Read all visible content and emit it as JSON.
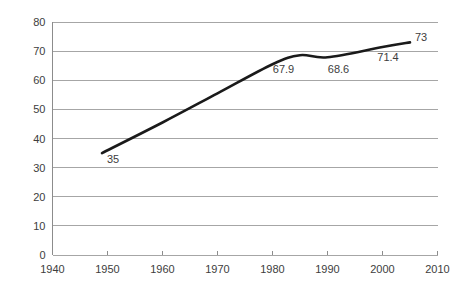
{
  "chart_data": {
    "type": "line",
    "title": "",
    "subtitle": "",
    "xlabel": "",
    "ylabel": "",
    "xlim": [
      1940,
      2010
    ],
    "ylim": [
      0,
      80
    ],
    "grid": true,
    "legend": false,
    "legend_position": "none",
    "x_ticks": [
      "1940",
      "1950",
      "1960",
      "1970",
      "1980",
      "1990",
      "2000",
      "2010"
    ],
    "x_tick_values": [
      1940,
      1950,
      1960,
      1970,
      1980,
      1990,
      2000,
      2010
    ],
    "y_ticks": [
      "0",
      "10",
      "20",
      "30",
      "40",
      "50",
      "60",
      "70",
      "80"
    ],
    "y_tick_values": [
      0,
      10,
      20,
      30,
      40,
      50,
      60,
      70,
      80
    ],
    "series": [
      {
        "name": "series-1",
        "color": "#1a1a1a",
        "x": [
          1949,
          1960,
          1970,
          1980,
          1985,
          1990,
          2000,
          2005
        ],
        "values": [
          35,
          45.5,
          55.5,
          65.5,
          68.6,
          67.9,
          71.4,
          73
        ]
      }
    ],
    "annotations": [
      {
        "text": "35",
        "x": 1951,
        "y": 31.5
      },
      {
        "text": "67.9",
        "x": 1982,
        "y": 62.5
      },
      {
        "text": "68.6",
        "x": 1992,
        "y": 62.5
      },
      {
        "text": "71.4",
        "x": 2001,
        "y": 66.5
      },
      {
        "text": "73",
        "x": 2007,
        "y": 73.5
      }
    ],
    "colors": {
      "line": "#1a1a1a",
      "gridline": "#a6a6a6",
      "axis": "#8c8c8c",
      "text": "#3d3d3d",
      "background": "#ffffff"
    }
  }
}
